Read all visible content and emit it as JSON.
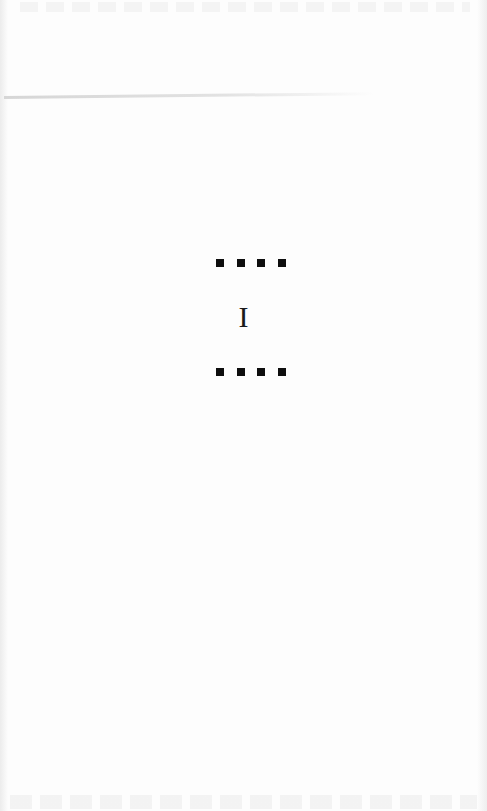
{
  "page": {
    "type": "book-page",
    "chapter_numeral": "I",
    "ornament": {
      "glyph": "square",
      "count_per_row": 4,
      "rows": [
        "above-heading",
        "below-heading"
      ],
      "color": "#0e0e0e"
    },
    "background_color": "#fdfdfd"
  }
}
